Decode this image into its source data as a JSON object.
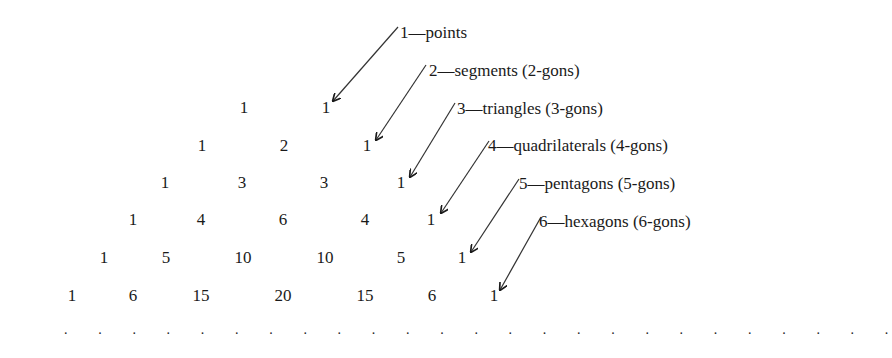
{
  "triangle": {
    "rows": [
      [
        1,
        1
      ],
      [
        1,
        2,
        1
      ],
      [
        1,
        3,
        3,
        1
      ],
      [
        1,
        4,
        6,
        4,
        1
      ],
      [
        1,
        5,
        10,
        10,
        5,
        1
      ],
      [
        1,
        6,
        15,
        20,
        15,
        6,
        1
      ]
    ],
    "continuation": ". . . . . . . . . . . . . . . . . . . . . . . . ."
  },
  "labels": [
    "1—points",
    "2—segments (2-gons)",
    "3—triangles (3-gons)",
    "4—quadrilaterals (4-gons)",
    "5—pentagons (5-gons)",
    "6—hexagons (6-gons)"
  ],
  "r": {
    "r0": [
      "1",
      "1"
    ],
    "r1": [
      "1",
      "2",
      "1"
    ],
    "r2": [
      "1",
      "3",
      "3",
      "1"
    ],
    "r3": [
      "1",
      "4",
      "6",
      "4",
      "1"
    ],
    "r4": [
      "1",
      "5",
      "10",
      "10",
      "5",
      "1"
    ],
    "r5": [
      "1",
      "6",
      "15",
      "20",
      "15",
      "6",
      "1"
    ]
  },
  "dots": ". . . . . . . . . . . . . . . . . . . . . . . . ."
}
